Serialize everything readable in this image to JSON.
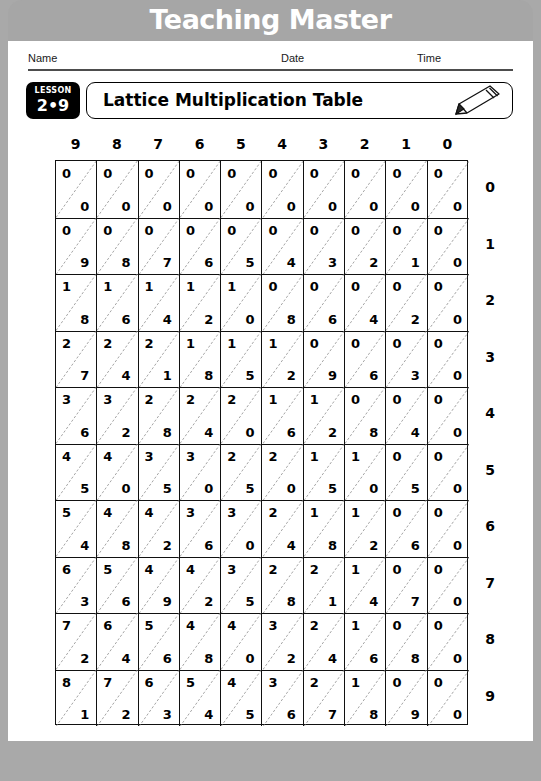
{
  "banner": {
    "title": "Teaching Master"
  },
  "info": {
    "name_label": "Name",
    "date_label": "Date",
    "time_label": "Time",
    "name_value": "",
    "date_value": "",
    "time_value": ""
  },
  "lesson": {
    "word": "LESSON",
    "number": "2•9"
  },
  "title": {
    "text": "Lattice Multiplication Table",
    "icon": "pencil-icon"
  },
  "colors": {
    "banner_gray": "#a6a6a6",
    "frame_gray": "#a9a9a9",
    "ink": "#000000",
    "rule": "#4d4d4d"
  },
  "chart_data": {
    "type": "table",
    "title": "Lattice Multiplication Table",
    "xlabel": "",
    "ylabel": "",
    "column_headers": [
      "9",
      "8",
      "7",
      "6",
      "5",
      "4",
      "3",
      "2",
      "1",
      "0"
    ],
    "row_headers": [
      "0",
      "1",
      "2",
      "3",
      "4",
      "5",
      "6",
      "7",
      "8",
      "9"
    ],
    "cell_format": "tens-digit upper-left, ones-digit lower-right, separated by diagonal",
    "rows": [
      {
        "row_label": "0",
        "cells": [
          {
            "tens": "0",
            "ones": "0"
          },
          {
            "tens": "0",
            "ones": "0"
          },
          {
            "tens": "0",
            "ones": "0"
          },
          {
            "tens": "0",
            "ones": "0"
          },
          {
            "tens": "0",
            "ones": "0"
          },
          {
            "tens": "0",
            "ones": "0"
          },
          {
            "tens": "0",
            "ones": "0"
          },
          {
            "tens": "0",
            "ones": "0"
          },
          {
            "tens": "0",
            "ones": "0"
          },
          {
            "tens": "0",
            "ones": "0"
          }
        ]
      },
      {
        "row_label": "1",
        "cells": [
          {
            "tens": "0",
            "ones": "9"
          },
          {
            "tens": "0",
            "ones": "8"
          },
          {
            "tens": "0",
            "ones": "7"
          },
          {
            "tens": "0",
            "ones": "6"
          },
          {
            "tens": "0",
            "ones": "5"
          },
          {
            "tens": "0",
            "ones": "4"
          },
          {
            "tens": "0",
            "ones": "3"
          },
          {
            "tens": "0",
            "ones": "2"
          },
          {
            "tens": "0",
            "ones": "1"
          },
          {
            "tens": "0",
            "ones": "0"
          }
        ]
      },
      {
        "row_label": "2",
        "cells": [
          {
            "tens": "1",
            "ones": "8"
          },
          {
            "tens": "1",
            "ones": "6"
          },
          {
            "tens": "1",
            "ones": "4"
          },
          {
            "tens": "1",
            "ones": "2"
          },
          {
            "tens": "1",
            "ones": "0"
          },
          {
            "tens": "0",
            "ones": "8"
          },
          {
            "tens": "0",
            "ones": "6"
          },
          {
            "tens": "0",
            "ones": "4"
          },
          {
            "tens": "0",
            "ones": "2"
          },
          {
            "tens": "0",
            "ones": "0"
          }
        ]
      },
      {
        "row_label": "3",
        "cells": [
          {
            "tens": "2",
            "ones": "7"
          },
          {
            "tens": "2",
            "ones": "4"
          },
          {
            "tens": "2",
            "ones": "1"
          },
          {
            "tens": "1",
            "ones": "8"
          },
          {
            "tens": "1",
            "ones": "5"
          },
          {
            "tens": "1",
            "ones": "2"
          },
          {
            "tens": "0",
            "ones": "9"
          },
          {
            "tens": "0",
            "ones": "6"
          },
          {
            "tens": "0",
            "ones": "3"
          },
          {
            "tens": "0",
            "ones": "0"
          }
        ]
      },
      {
        "row_label": "4",
        "cells": [
          {
            "tens": "3",
            "ones": "6"
          },
          {
            "tens": "3",
            "ones": "2"
          },
          {
            "tens": "2",
            "ones": "8"
          },
          {
            "tens": "2",
            "ones": "4"
          },
          {
            "tens": "2",
            "ones": "0"
          },
          {
            "tens": "1",
            "ones": "6"
          },
          {
            "tens": "1",
            "ones": "2"
          },
          {
            "tens": "0",
            "ones": "8"
          },
          {
            "tens": "0",
            "ones": "4"
          },
          {
            "tens": "0",
            "ones": "0"
          }
        ]
      },
      {
        "row_label": "5",
        "cells": [
          {
            "tens": "4",
            "ones": "5"
          },
          {
            "tens": "4",
            "ones": "0"
          },
          {
            "tens": "3",
            "ones": "5"
          },
          {
            "tens": "3",
            "ones": "0"
          },
          {
            "tens": "2",
            "ones": "5"
          },
          {
            "tens": "2",
            "ones": "0"
          },
          {
            "tens": "1",
            "ones": "5"
          },
          {
            "tens": "1",
            "ones": "0"
          },
          {
            "tens": "0",
            "ones": "5"
          },
          {
            "tens": "0",
            "ones": "0"
          }
        ]
      },
      {
        "row_label": "6",
        "cells": [
          {
            "tens": "5",
            "ones": "4"
          },
          {
            "tens": "4",
            "ones": "8"
          },
          {
            "tens": "4",
            "ones": "2"
          },
          {
            "tens": "3",
            "ones": "6"
          },
          {
            "tens": "3",
            "ones": "0"
          },
          {
            "tens": "2",
            "ones": "4"
          },
          {
            "tens": "1",
            "ones": "8"
          },
          {
            "tens": "1",
            "ones": "2"
          },
          {
            "tens": "0",
            "ones": "6"
          },
          {
            "tens": "0",
            "ones": "0"
          }
        ]
      },
      {
        "row_label": "7",
        "cells": [
          {
            "tens": "6",
            "ones": "3"
          },
          {
            "tens": "5",
            "ones": "6"
          },
          {
            "tens": "4",
            "ones": "9"
          },
          {
            "tens": "4",
            "ones": "2"
          },
          {
            "tens": "3",
            "ones": "5"
          },
          {
            "tens": "2",
            "ones": "8"
          },
          {
            "tens": "2",
            "ones": "1"
          },
          {
            "tens": "1",
            "ones": "4"
          },
          {
            "tens": "0",
            "ones": "7"
          },
          {
            "tens": "0",
            "ones": "0"
          }
        ]
      },
      {
        "row_label": "8",
        "cells": [
          {
            "tens": "7",
            "ones": "2"
          },
          {
            "tens": "6",
            "ones": "4"
          },
          {
            "tens": "5",
            "ones": "6"
          },
          {
            "tens": "4",
            "ones": "8"
          },
          {
            "tens": "4",
            "ones": "0"
          },
          {
            "tens": "3",
            "ones": "2"
          },
          {
            "tens": "2",
            "ones": "4"
          },
          {
            "tens": "1",
            "ones": "6"
          },
          {
            "tens": "0",
            "ones": "8"
          },
          {
            "tens": "0",
            "ones": "0"
          }
        ]
      },
      {
        "row_label": "9",
        "cells": [
          {
            "tens": "8",
            "ones": "1"
          },
          {
            "tens": "7",
            "ones": "2"
          },
          {
            "tens": "6",
            "ones": "3"
          },
          {
            "tens": "5",
            "ones": "4"
          },
          {
            "tens": "4",
            "ones": "5"
          },
          {
            "tens": "3",
            "ones": "6"
          },
          {
            "tens": "2",
            "ones": "7"
          },
          {
            "tens": "1",
            "ones": "8"
          },
          {
            "tens": "0",
            "ones": "9"
          },
          {
            "tens": "0",
            "ones": "0"
          }
        ]
      }
    ]
  }
}
